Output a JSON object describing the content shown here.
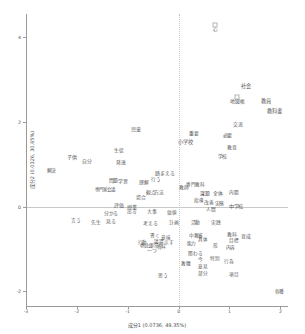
{
  "chart_data": {
    "type": "scatter",
    "title": "",
    "xlabel": "成分1 (0.0736, 49.35%)",
    "ylabel": "成分2 (0.0326, 30.65%)",
    "xlim": [
      -3,
      2.15
    ],
    "ylim": [
      -2.35,
      4.55
    ],
    "xticks": [
      "-3",
      "-2",
      "-1",
      "0",
      "1",
      "2"
    ],
    "xtick_values": [
      -3,
      -2,
      -1,
      0,
      1,
      2
    ],
    "yticks": [
      "4",
      "2",
      "0",
      "-2"
    ],
    "ytick_values": [
      4,
      2,
      0,
      -2
    ],
    "grid": false,
    "legend": "none",
    "origin_lines": true,
    "point_style": "open-square-marker-with-text-label",
    "points": [
      {
        "label": "心",
        "x": 0.72,
        "y": 4.3,
        "size": 4.6,
        "marker": true
      },
      {
        "label": "社会",
        "x": 1.32,
        "y": 2.82,
        "size": 5.2,
        "marker": false
      },
      {
        "label": "地図帳",
        "x": 1.15,
        "y": 2.6,
        "size": 4.8,
        "marker": true
      },
      {
        "label": "教員",
        "x": 1.72,
        "y": 2.47,
        "size": 5.2,
        "marker": false
      },
      {
        "label": "教科書",
        "x": 1.88,
        "y": 2.24,
        "size": 5.2,
        "marker": false
      },
      {
        "label": "交流",
        "x": 1.16,
        "y": 1.93,
        "size": 4.8,
        "marker": false
      },
      {
        "label": "必要",
        "x": 0.96,
        "y": 1.7,
        "size": 5.0,
        "marker": false
      },
      {
        "label": "児童",
        "x": -0.84,
        "y": 1.83,
        "size": 5.0,
        "marker": false
      },
      {
        "label": "重要",
        "x": 0.3,
        "y": 1.72,
        "size": 4.8,
        "marker": false
      },
      {
        "label": "小学校",
        "x": 0.13,
        "y": 1.5,
        "size": 5.2,
        "marker": false
      },
      {
        "label": "教育",
        "x": 1.04,
        "y": 1.39,
        "size": 4.8,
        "marker": false
      },
      {
        "label": "学校",
        "x": 0.86,
        "y": 1.17,
        "size": 4.8,
        "marker": false
      },
      {
        "label": "生徒",
        "x": -1.18,
        "y": 1.32,
        "size": 4.8,
        "marker": false
      },
      {
        "label": "子供",
        "x": -2.1,
        "y": 1.18,
        "size": 5.0,
        "marker": false
      },
      {
        "label": "自分",
        "x": -1.8,
        "y": 1.06,
        "size": 4.8,
        "marker": false
      },
      {
        "label": "発達",
        "x": -1.14,
        "y": 1.04,
        "size": 4.8,
        "marker": false
      },
      {
        "label": "解決",
        "x": -2.5,
        "y": 0.83,
        "size": 4.8,
        "marker": false
      },
      {
        "label": "踏まえる",
        "x": -0.27,
        "y": 0.77,
        "size": 4.8,
        "marker": false
      },
      {
        "label": "行う",
        "x": -0.45,
        "y": 0.63,
        "size": 4.6,
        "marker": false
      },
      {
        "label": "問題",
        "x": -1.28,
        "y": 0.6,
        "size": 4.8,
        "marker": false
      },
      {
        "label": "学習",
        "x": -1.1,
        "y": 0.58,
        "size": 4.8,
        "marker": false
      },
      {
        "label": "理解",
        "x": -0.68,
        "y": 0.55,
        "size": 4.8,
        "marker": false
      },
      {
        "label": "専門教科",
        "x": 0.33,
        "y": 0.5,
        "size": 4.6,
        "marker": false
      },
      {
        "label": "教師",
        "x": 0.1,
        "y": 0.43,
        "size": 4.8,
        "marker": false
      },
      {
        "label": "専門家会議",
        "x": -1.45,
        "y": 0.38,
        "size": 4.4,
        "marker": false
      },
      {
        "label": "観点",
        "x": -0.54,
        "y": 0.33,
        "size": 4.8,
        "marker": false
      },
      {
        "label": "方法",
        "x": -0.38,
        "y": 0.31,
        "size": 4.8,
        "marker": false
      },
      {
        "label": "課題",
        "x": 0.52,
        "y": 0.3,
        "size": 4.8,
        "marker": false
      },
      {
        "label": "全体",
        "x": 0.78,
        "y": 0.3,
        "size": 4.8,
        "marker": false
      },
      {
        "label": "内閣",
        "x": 1.08,
        "y": 0.31,
        "size": 4.6,
        "marker": false
      },
      {
        "label": "場合",
        "x": -0.74,
        "y": 0.2,
        "size": 4.8,
        "marker": false
      },
      {
        "label": "指導",
        "x": 0.4,
        "y": 0.12,
        "size": 4.6,
        "marker": false
      },
      {
        "label": "改善",
        "x": 0.6,
        "y": 0.09,
        "size": 4.8,
        "marker": false
      },
      {
        "label": "実態",
        "x": 0.8,
        "y": 0.06,
        "size": 4.8,
        "marker": false
      },
      {
        "label": "中学校",
        "x": 1.13,
        "y": 0.02,
        "size": 5.0,
        "marker": false
      },
      {
        "label": "評価",
        "x": -1.18,
        "y": 0.02,
        "size": 4.8,
        "marker": false
      },
      {
        "label": "授業",
        "x": -0.92,
        "y": -0.01,
        "size": 5.0,
        "marker": false
      },
      {
        "label": "人間",
        "x": 0.63,
        "y": -0.09,
        "size": 4.6,
        "marker": false
      },
      {
        "label": "出る",
        "x": -0.92,
        "y": -0.13,
        "size": 4.6,
        "marker": false
      },
      {
        "label": "分かる",
        "x": -1.33,
        "y": -0.17,
        "size": 4.8,
        "marker": false
      },
      {
        "label": "大事",
        "x": -0.52,
        "y": -0.12,
        "size": 4.8,
        "marker": false
      },
      {
        "label": "価値",
        "x": -0.13,
        "y": -0.15,
        "size": 4.6,
        "marker": false
      },
      {
        "label": "言う",
        "x": -2.02,
        "y": -0.33,
        "size": 4.8,
        "marker": false
      },
      {
        "label": "先生",
        "x": -1.62,
        "y": -0.4,
        "size": 4.8,
        "marker": false
      },
      {
        "label": "見る",
        "x": -1.33,
        "y": -0.37,
        "size": 4.8,
        "marker": false
      },
      {
        "label": "考える",
        "x": -0.56,
        "y": -0.41,
        "size": 4.8,
        "marker": false
      },
      {
        "label": "計画",
        "x": -0.09,
        "y": -0.39,
        "size": 4.8,
        "marker": false
      },
      {
        "label": "活動",
        "x": 0.33,
        "y": -0.4,
        "size": 4.8,
        "marker": false
      },
      {
        "label": "実践",
        "x": 0.73,
        "y": -0.39,
        "size": 4.8,
        "marker": false
      },
      {
        "label": "書く",
        "x": -0.47,
        "y": -0.7,
        "size": 4.8,
        "marker": false
      },
      {
        "label": "意味",
        "x": -0.25,
        "y": -0.74,
        "size": 4.6,
        "marker": false
      },
      {
        "label": "中教審",
        "x": 0.34,
        "y": -0.69,
        "size": 4.6,
        "marker": false
      },
      {
        "label": "教科",
        "x": 1.05,
        "y": -0.68,
        "size": 4.8,
        "marker": false
      },
      {
        "label": "育成",
        "x": 1.33,
        "y": -0.72,
        "size": 4.8,
        "marker": false
      },
      {
        "label": "具体",
        "x": 0.47,
        "y": -0.79,
        "size": 4.6,
        "marker": false
      },
      {
        "label": "目標",
        "x": 1.08,
        "y": -0.82,
        "size": 4.6,
        "marker": false
      },
      {
        "label": "行動",
        "x": -0.72,
        "y": -0.86,
        "size": 4.4,
        "marker": false
      },
      {
        "label": "議論",
        "x": -0.38,
        "y": -0.84,
        "size": 4.6,
        "marker": false
      },
      {
        "label": "示す",
        "x": -0.19,
        "y": -0.85,
        "size": 4.6,
        "marker": false
      },
      {
        "label": "能力",
        "x": 0.25,
        "y": -0.89,
        "size": 4.6,
        "marker": false
      },
      {
        "label": "委員会",
        "x": -0.64,
        "y": -0.93,
        "size": 4.4,
        "marker": false
      },
      {
        "label": "非常",
        "x": -0.49,
        "y": -0.93,
        "size": 4.4,
        "marker": false
      },
      {
        "label": "資料",
        "x": -0.34,
        "y": -0.95,
        "size": 4.6,
        "marker": false
      },
      {
        "label": "形",
        "x": 0.73,
        "y": -0.93,
        "size": 4.6,
        "marker": false
      },
      {
        "label": "内容",
        "x": 1.02,
        "y": -0.97,
        "size": 4.8,
        "marker": false
      },
      {
        "label": "一つ",
        "x": -0.53,
        "y": -1.06,
        "size": 4.8,
        "marker": false
      },
      {
        "label": "関わる",
        "x": 0.33,
        "y": -1.12,
        "size": 4.6,
        "marker": false
      },
      {
        "label": "今",
        "x": 0.42,
        "y": -1.27,
        "size": 4.6,
        "marker": false
      },
      {
        "label": "特別",
        "x": 0.72,
        "y": -1.24,
        "size": 4.6,
        "marker": false
      },
      {
        "label": "行為",
        "x": 0.99,
        "y": -1.31,
        "size": 4.6,
        "marker": false
      },
      {
        "label": "教職",
        "x": 0.14,
        "y": -1.35,
        "size": 4.6,
        "marker": false
      },
      {
        "label": "意見",
        "x": 0.48,
        "y": -1.44,
        "size": 4.6,
        "marker": false
      },
      {
        "label": "思う",
        "x": -0.31,
        "y": -1.63,
        "size": 4.8,
        "marker": false
      },
      {
        "label": "部分",
        "x": 0.47,
        "y": -1.6,
        "size": 4.6,
        "marker": false
      },
      {
        "label": "項目",
        "x": 1.09,
        "y": -1.62,
        "size": 4.6,
        "marker": false
      },
      {
        "label": "各種",
        "x": 1.98,
        "y": -2.03,
        "size": 4.6,
        "marker": false
      }
    ]
  }
}
